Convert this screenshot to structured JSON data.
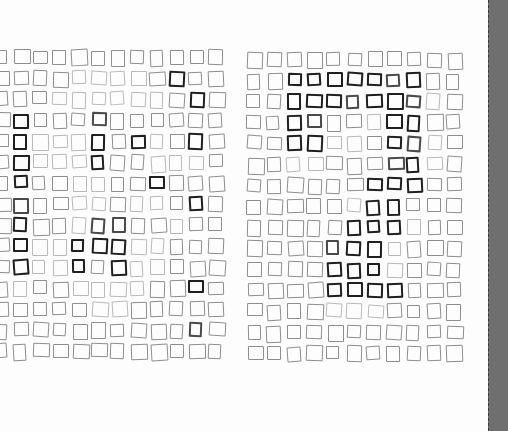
{
  "scene": {
    "description": "Scanned paper with two hand-drawn grids of small pencil squares; darker squares form patterns; gray binding strip at right edge",
    "colors": {
      "paper": "#fdfdfd",
      "binding": "#6f6f6f",
      "light": "#b9b9b9",
      "medium": "#8e8e8e",
      "dark": "#4a4a4a",
      "very_dark": "#1f1f1f"
    }
  },
  "grids": [
    {
      "name": "left-grid",
      "origin": [
        -6,
        50
      ],
      "step": [
        19.5,
        21
      ],
      "cells": [
        [
          1,
          1,
          1,
          1,
          1,
          1,
          1,
          1,
          1,
          1,
          1,
          1
        ],
        [
          1,
          1,
          1,
          1,
          0,
          0,
          0,
          0,
          1,
          3,
          1,
          1
        ],
        [
          1,
          1,
          1,
          0,
          0,
          0,
          0,
          0,
          0,
          1,
          3,
          1
        ],
        [
          1,
          3,
          1,
          1,
          1,
          2,
          1,
          1,
          1,
          1,
          1,
          1
        ],
        [
          1,
          3,
          0,
          0,
          0,
          3,
          1,
          3,
          0,
          1,
          3,
          1
        ],
        [
          1,
          3,
          0,
          0,
          0,
          3,
          1,
          1,
          0,
          0,
          0,
          1
        ],
        [
          1,
          3,
          1,
          1,
          0,
          0,
          1,
          1,
          3,
          1,
          1,
          1
        ],
        [
          1,
          2,
          1,
          1,
          0,
          0,
          1,
          0,
          0,
          1,
          3,
          1
        ],
        [
          1,
          3,
          1,
          1,
          0,
          2,
          2,
          1,
          1,
          0,
          1,
          1
        ],
        [
          1,
          3,
          0,
          0,
          3,
          3,
          3,
          0,
          0,
          1,
          1,
          1
        ],
        [
          1,
          3,
          0,
          0,
          3,
          1,
          3,
          0,
          0,
          1,
          1,
          1
        ],
        [
          1,
          0,
          1,
          1,
          0,
          0,
          0,
          0,
          1,
          1,
          3,
          1
        ],
        [
          1,
          1,
          1,
          1,
          1,
          0,
          0,
          1,
          1,
          1,
          1,
          1
        ],
        [
          1,
          1,
          1,
          1,
          1,
          1,
          1,
          1,
          1,
          1,
          2,
          1
        ],
        [
          1,
          1,
          1,
          1,
          1,
          1,
          1,
          1,
          1,
          1,
          1,
          1
        ]
      ]
    },
    {
      "name": "right-grid",
      "origin": [
        247,
        52
      ],
      "step": [
        20,
        21
      ],
      "cells": [
        [
          1,
          1,
          1,
          1,
          1,
          1,
          1,
          1,
          1,
          1,
          1
        ],
        [
          1,
          1,
          3,
          3,
          3,
          3,
          3,
          2,
          3,
          1,
          1
        ],
        [
          1,
          1,
          3,
          3,
          3,
          2,
          3,
          3,
          2,
          0,
          1
        ],
        [
          1,
          1,
          3,
          2,
          1,
          1,
          0,
          3,
          3,
          1,
          1
        ],
        [
          1,
          1,
          3,
          3,
          0,
          0,
          1,
          3,
          2,
          0,
          1
        ],
        [
          1,
          1,
          0,
          0,
          1,
          1,
          1,
          2,
          3,
          0,
          1
        ],
        [
          1,
          1,
          1,
          1,
          1,
          1,
          3,
          3,
          3,
          1,
          1
        ],
        [
          1,
          1,
          1,
          1,
          1,
          0,
          3,
          3,
          1,
          1,
          1
        ],
        [
          1,
          1,
          1,
          1,
          1,
          3,
          3,
          3,
          0,
          1,
          1
        ],
        [
          1,
          1,
          1,
          1,
          2,
          3,
          3,
          0,
          1,
          1,
          1
        ],
        [
          1,
          1,
          1,
          1,
          3,
          3,
          3,
          0,
          1,
          1,
          1
        ],
        [
          1,
          1,
          1,
          1,
          3,
          3,
          3,
          3,
          1,
          1,
          1
        ],
        [
          1,
          1,
          1,
          1,
          0,
          0,
          0,
          1,
          1,
          1,
          1
        ],
        [
          1,
          1,
          1,
          1,
          1,
          1,
          1,
          1,
          1,
          1,
          1
        ],
        [
          1,
          1,
          1,
          1,
          1,
          1,
          1,
          1,
          1,
          1,
          1
        ]
      ]
    }
  ]
}
